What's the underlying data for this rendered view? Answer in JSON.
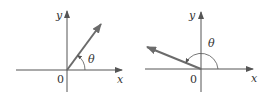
{
  "diagrams": [
    {
      "name": "angle-first-quadrant",
      "x_label": "x",
      "y_label": "y",
      "origin_label": "0",
      "angle_label": "θ"
    },
    {
      "name": "angle-second-quadrant",
      "x_label": "x",
      "y_label": "y",
      "origin_label": "0",
      "angle_label": "θ"
    }
  ],
  "colors": {
    "axis": "#555555",
    "vector": "#6b6b6b",
    "arc": "#555555",
    "text": "#333333"
  }
}
